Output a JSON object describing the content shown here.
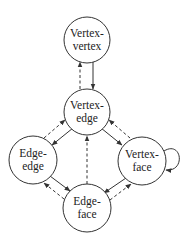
{
  "diagram": {
    "nodes": [
      {
        "id": "vv",
        "line1": "Vertex-",
        "line2": "vertex",
        "cx": 87,
        "cy": 40,
        "r": 23
      },
      {
        "id": "ve",
        "line1": "Vertex-",
        "line2": "edge",
        "cx": 87,
        "cy": 112,
        "r": 23
      },
      {
        "id": "ee",
        "line1": "Edge-",
        "line2": "edge",
        "cx": 33,
        "cy": 160,
        "r": 24
      },
      {
        "id": "vf",
        "line1": "Vertex-",
        "line2": "face",
        "cx": 142,
        "cy": 161,
        "r": 24
      },
      {
        "id": "ef",
        "line1": "Edge-",
        "line2": "face",
        "cx": 87,
        "cy": 208,
        "r": 24
      }
    ],
    "edges": [
      {
        "from": "vv",
        "to": "ve",
        "style": "solid"
      },
      {
        "from": "ve",
        "to": "vv",
        "style": "dashed"
      },
      {
        "from": "ve",
        "to": "ee",
        "style": "solid"
      },
      {
        "from": "ee",
        "to": "ve",
        "style": "dashed"
      },
      {
        "from": "ve",
        "to": "vf",
        "style": "solid"
      },
      {
        "from": "vf",
        "to": "ve",
        "style": "dashed"
      },
      {
        "from": "ee",
        "to": "ef",
        "style": "solid"
      },
      {
        "from": "ef",
        "to": "ee",
        "style": "dashed"
      },
      {
        "from": "vf",
        "to": "ef",
        "style": "solid"
      },
      {
        "from": "ef",
        "to": "vf",
        "style": "dashed"
      },
      {
        "from": "ef",
        "to": "ve",
        "style": "dashed"
      },
      {
        "from": "vf",
        "to": "vf",
        "style": "solid",
        "self_loop": true
      }
    ],
    "legend": {
      "solid": "solid arrow",
      "dashed": "dashed arrow"
    }
  }
}
